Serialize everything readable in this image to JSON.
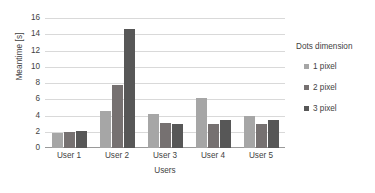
{
  "chart_data": {
    "type": "bar",
    "title": "",
    "xlabel": "Users",
    "ylabel": "Meantime [s]",
    "categories": [
      "User 1",
      "User 2",
      "User 3",
      "User 4",
      "User 5"
    ],
    "series": [
      {
        "name": "1 pixel",
        "color": "#a6a6a6",
        "values": [
          1.9,
          4.5,
          4.2,
          6.2,
          3.9
        ]
      },
      {
        "name": "2 pixel",
        "color": "#767171",
        "values": [
          2.0,
          7.8,
          3.1,
          3.0,
          3.0
        ]
      },
      {
        "name": "3 pixel",
        "color": "#575757",
        "values": [
          2.1,
          14.6,
          2.9,
          3.4,
          3.5
        ]
      }
    ],
    "ylim": [
      0,
      16
    ],
    "yticks": [
      0,
      2,
      4,
      6,
      8,
      10,
      12,
      14,
      16
    ],
    "ytick_labels": [
      "0",
      "2",
      "4",
      "6",
      "8",
      "10",
      "12",
      "14",
      "16"
    ],
    "grid": true,
    "grid_color": "#d9d9d9",
    "legend": {
      "title": "Dots dimension",
      "position": "right",
      "entries": [
        "1 pixel",
        "2 pixel",
        "3 pixel"
      ]
    },
    "background": "#ffffff",
    "text_color": "#3f3f3f"
  }
}
